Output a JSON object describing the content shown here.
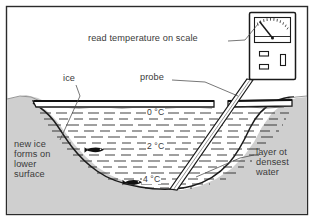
{
  "figure": {
    "border_color": "#2b2b2b",
    "bank_fill": "#cfcfcf",
    "water_fill": "#ffffff",
    "ink_color": "#1a1a1a",
    "text_color": "#3a3a3a"
  },
  "annotations": {
    "read_temperature": "read temperature on scale",
    "ice": "ice",
    "probe": "probe",
    "new_ice": "new ice\nforms on\nlower\nsurface",
    "densest_water": "layer ot\ndensest\nwater"
  },
  "temperature_labels": [
    {
      "id": "surface",
      "text": "0 °C",
      "value": 0,
      "unit": "°C",
      "depth": "just below ice"
    },
    {
      "id": "middle",
      "text": "2 °C",
      "value": 2,
      "unit": "°C",
      "depth": "mid water"
    },
    {
      "id": "bottom",
      "text": "4 °C",
      "value": 4,
      "unit": "°C",
      "depth": "lake bed"
    }
  ],
  "instrument": {
    "name": "thermometer-meter",
    "gauge": {
      "needle_reading": "left of centre",
      "tick_count": 11
    },
    "buttons": [
      {
        "name": "upper-button",
        "shape": "horizontal-rectangle"
      },
      {
        "name": "lower-button",
        "shape": "horizontal-rectangle"
      },
      {
        "name": "side-slot",
        "shape": "vertical-rectangle"
      }
    ]
  },
  "fish": [
    {
      "id": "fish-upper",
      "near_label": "2 °C"
    },
    {
      "id": "fish-lower",
      "near_label": "4 °C"
    }
  ]
}
